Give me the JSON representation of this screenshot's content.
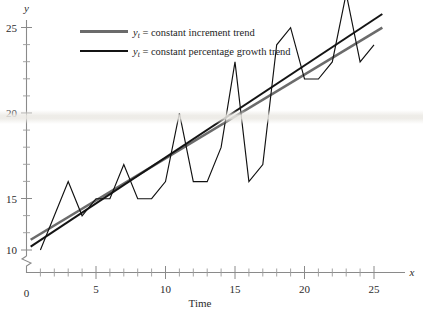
{
  "chart_data": {
    "type": "line",
    "title": "",
    "xlabel": "Time",
    "ylabel": "y",
    "x_axis_symbol": "x",
    "y_axis_symbol": "y",
    "xlim": [
      0,
      26
    ],
    "ylim": [
      9,
      26
    ],
    "y_axis_origin_label": "0",
    "y_axis_break": true,
    "grid": false,
    "legend_position": "top-left-inside",
    "x": [
      1,
      2,
      3,
      4,
      5,
      6,
      7,
      8,
      9,
      10,
      11,
      12,
      13,
      14,
      15,
      16,
      17,
      18,
      19,
      20,
      21,
      22,
      23,
      24,
      25
    ],
    "series": [
      {
        "name": "observed series",
        "type": "line",
        "color": "#111111",
        "values": [
          10,
          12,
          14,
          12,
          13,
          13,
          15,
          13,
          13,
          14,
          18,
          14,
          14,
          16,
          21,
          14,
          15,
          22,
          23,
          20,
          20,
          21,
          25,
          21,
          22
        ]
      },
      {
        "name": "y_t = constant increment trend",
        "type": "trend",
        "color": "#6b6b6b",
        "endpoints": [
          [
            0.3,
            10.6
          ],
          [
            25.6,
            23.0
          ]
        ]
      },
      {
        "name": "y_t = constant percentage growth trend",
        "type": "trend",
        "color": "#141414",
        "endpoints": [
          [
            0.3,
            10.2
          ],
          [
            25.6,
            23.8
          ]
        ]
      }
    ],
    "x_ticks_major": [
      5,
      10,
      15,
      20,
      25
    ],
    "x_ticks_major_labels": [
      "5",
      "10",
      "15",
      "20",
      "25"
    ],
    "x_ticks_minor": [
      1,
      2,
      3,
      4,
      6,
      7,
      8,
      9,
      11,
      12,
      13,
      14,
      16,
      17,
      18,
      19,
      21,
      22,
      23,
      24
    ],
    "y_ticks_major": [
      10,
      15,
      20,
      25
    ],
    "y_ticks_major_labels": [
      "10",
      "15",
      "20",
      "25"
    ],
    "y_ticks_minor": [
      11,
      12,
      13,
      14,
      16,
      17,
      18,
      19,
      21,
      22,
      23,
      24
    ]
  },
  "legend": {
    "items": [
      {
        "symbol": "y",
        "subscript": "t",
        "equals": " = ",
        "label": "constant increment trend",
        "color": "#6b6b6b"
      },
      {
        "symbol": "y",
        "subscript": "t",
        "equals": " = ",
        "label": "constant percentage growth trend",
        "color": "#141414"
      }
    ]
  },
  "axes": {
    "x_title": "Time",
    "x_symbol": "x",
    "y_symbol": "y",
    "origin_label": "0"
  }
}
